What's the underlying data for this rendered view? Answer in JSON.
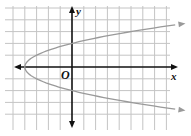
{
  "chart_data": {
    "type": "line",
    "title": "",
    "equation": "x = y^2 - 4",
    "xlabel": "x",
    "ylabel": "y",
    "origin_label": "O",
    "xlim": [
      -5,
      8
    ],
    "ylim": [
      -5,
      5
    ],
    "grid": true,
    "tick_labels": false,
    "series": [
      {
        "name": "parabola",
        "color": "#9a9a9a",
        "vertex": [
          -4,
          0
        ],
        "y_intercepts": [
          2,
          -2
        ],
        "x": [
          8.7,
          5,
          2,
          0,
          -2,
          -3,
          -4,
          -3,
          -2,
          0,
          2,
          5,
          8.7
        ],
        "y": [
          3.57,
          3,
          2.45,
          2,
          1.41,
          1,
          0,
          -1,
          -1.41,
          -2,
          -2.45,
          -3,
          -3.57
        ],
        "arrows": [
          "upper-right",
          "lower-right"
        ]
      }
    ],
    "colors": {
      "grid": "#c4c4c4",
      "axes": "#111111",
      "curve": "#9a9a9a"
    }
  }
}
